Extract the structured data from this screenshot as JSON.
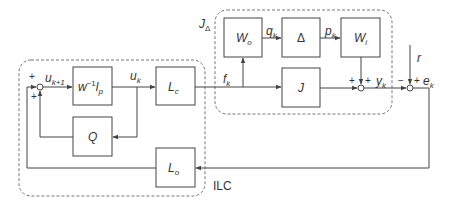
{
  "diagram": {
    "groups": {
      "ilc": {
        "label": "ILC"
      },
      "jdelta": {
        "label": "J",
        "label_sub": "Δ"
      }
    },
    "blocks": {
      "w_inv_lp": {
        "label": "w",
        "sup": "−1",
        "label2": "l",
        "sub": "p"
      },
      "q": {
        "label": "Q"
      },
      "lc": {
        "label": "L",
        "sub": "c"
      },
      "lo": {
        "label": "L",
        "sub": "o"
      },
      "wo": {
        "label": "W",
        "sub": "o"
      },
      "delta": {
        "label": "Δ"
      },
      "wi": {
        "label": "W",
        "sub": "i"
      },
      "j": {
        "label": "J"
      }
    },
    "signals": {
      "u_k1": {
        "label": "u",
        "sub": "k+1"
      },
      "u_k": {
        "label": "u",
        "sub": "k"
      },
      "f_k": {
        "label": "f",
        "sub": "k"
      },
      "q_k": {
        "label": "q",
        "sub": "k"
      },
      "p_k": {
        "label": "p",
        "sub": "k"
      },
      "y_k": {
        "label": "y",
        "sub": "k"
      },
      "e_k": {
        "label": "e",
        "sub": "k"
      },
      "r": {
        "label": "r"
      }
    },
    "signs": {
      "sum1_top": "+",
      "sum1_bottom": "+",
      "sum2_left": "+",
      "sum2_top": "+",
      "sum3_left": "−",
      "sum3_top": "+"
    },
    "colors": {
      "line": "#444444",
      "dash": "#777777"
    }
  }
}
